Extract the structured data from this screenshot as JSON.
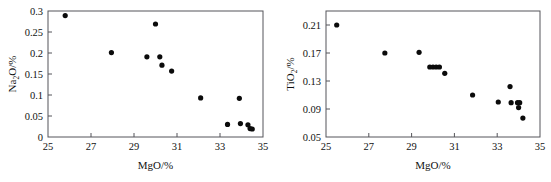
{
  "figure": {
    "panels": [
      "left",
      "right"
    ]
  },
  "chart_data": [
    {
      "id": "left",
      "type": "scatter",
      "title": "",
      "xlabel": "MgO/%",
      "ylabel": "Na2O/%",
      "ylabel_parts": {
        "pre": "Na",
        "sub": "2",
        "post": "O/%"
      },
      "xlabel_parts": {
        "pre": "MgO/%",
        "sub": "",
        "post": ""
      },
      "xlim": [
        25,
        35
      ],
      "ylim": [
        0,
        0.3
      ],
      "xticks": [
        25,
        27,
        29,
        31,
        33,
        35
      ],
      "xtick_labels": [
        "25",
        "27",
        "29",
        "31",
        "33",
        "35"
      ],
      "yticks": [
        0,
        0.05,
        0.1,
        0.15,
        0.2,
        0.25,
        0.3
      ],
      "ytick_labels": [
        "0",
        "0.05",
        "0.1",
        "0.15",
        "0.2",
        "0.25",
        "0.3"
      ],
      "grid": false,
      "legend": null,
      "marker": "filled-circle",
      "marker_color": "#0b0b0b",
      "points": [
        {
          "x": 25.8,
          "y": 0.289
        },
        {
          "x": 27.95,
          "y": 0.201
        },
        {
          "x": 29.6,
          "y": 0.191
        },
        {
          "x": 30.0,
          "y": 0.269
        },
        {
          "x": 30.2,
          "y": 0.191
        },
        {
          "x": 30.3,
          "y": 0.171
        },
        {
          "x": 30.75,
          "y": 0.157
        },
        {
          "x": 32.1,
          "y": 0.093
        },
        {
          "x": 33.35,
          "y": 0.03
        },
        {
          "x": 33.9,
          "y": 0.092
        },
        {
          "x": 33.95,
          "y": 0.032
        },
        {
          "x": 34.3,
          "y": 0.029
        },
        {
          "x": 34.4,
          "y": 0.02
        },
        {
          "x": 34.5,
          "y": 0.019
        }
      ]
    },
    {
      "id": "right",
      "type": "scatter",
      "title": "",
      "xlabel": "MgO/%",
      "ylabel": "TiO2/%",
      "ylabel_parts": {
        "pre": "TiO",
        "sub": "2",
        "post": "/%"
      },
      "xlabel_parts": {
        "pre": "MgO/%",
        "sub": "",
        "post": ""
      },
      "xlim": [
        25,
        35
      ],
      "ylim": [
        0.05,
        0.23
      ],
      "xticks": [
        25,
        27,
        29,
        31,
        33,
        35
      ],
      "xtick_labels": [
        "25",
        "27",
        "29",
        "31",
        "33",
        "35"
      ],
      "yticks": [
        0.05,
        0.09,
        0.13,
        0.17,
        0.21
      ],
      "ytick_labels": [
        "0.05",
        "0.09",
        "0.13",
        "0.17",
        "0.21"
      ],
      "grid": false,
      "legend": null,
      "marker": "filled-circle",
      "marker_color": "#0b0b0b",
      "points": [
        {
          "x": 25.5,
          "y": 0.21
        },
        {
          "x": 27.75,
          "y": 0.17
        },
        {
          "x": 29.35,
          "y": 0.171
        },
        {
          "x": 29.85,
          "y": 0.15
        },
        {
          "x": 30.0,
          "y": 0.15
        },
        {
          "x": 30.15,
          "y": 0.15
        },
        {
          "x": 30.3,
          "y": 0.15
        },
        {
          "x": 30.55,
          "y": 0.141
        },
        {
          "x": 31.85,
          "y": 0.11
        },
        {
          "x": 33.05,
          "y": 0.1
        },
        {
          "x": 33.6,
          "y": 0.122
        },
        {
          "x": 33.65,
          "y": 0.099
        },
        {
          "x": 33.95,
          "y": 0.099
        },
        {
          "x": 34.0,
          "y": 0.092
        },
        {
          "x": 34.05,
          "y": 0.099
        },
        {
          "x": 34.2,
          "y": 0.077
        }
      ]
    }
  ]
}
